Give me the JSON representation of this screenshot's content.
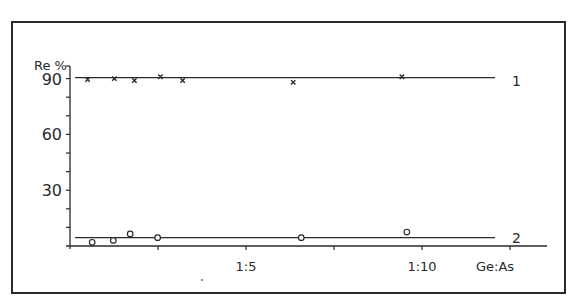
{
  "chart_data": {
    "type": "scatter",
    "title": "",
    "xlabel": "Ge:As",
    "ylabel": "Re %",
    "xlim": [
      0,
      12.5
    ],
    "ylim": [
      0,
      90
    ],
    "x_ticks": [
      0,
      2.5,
      5,
      7.5,
      10,
      12.5
    ],
    "x_tick_labels": [
      {
        "value": 5,
        "label": "1:5"
      },
      {
        "value": 10,
        "label": "1:10"
      }
    ],
    "y_ticks": [
      0,
      10,
      20,
      30,
      40,
      50,
      60,
      70,
      80,
      90
    ],
    "y_tick_labels": [
      {
        "value": 30,
        "label": "30"
      },
      {
        "value": 60,
        "label": "60"
      },
      {
        "value": 90,
        "label": "90"
      }
    ],
    "grid": false,
    "legend": "inline line labels at right",
    "series": [
      {
        "name": "1",
        "marker": "x",
        "fit_line": 90.5,
        "x": [
          0.5,
          1.26,
          1.83,
          2.57,
          3.2,
          6.34,
          9.43
        ],
        "y": [
          89.5,
          90,
          89,
          91,
          89,
          88,
          91
        ]
      },
      {
        "name": "2",
        "marker": "open-circle",
        "fit_line": 4.5,
        "x": [
          0.63,
          1.23,
          1.71,
          2.49,
          6.57,
          9.57
        ],
        "y": [
          2,
          3,
          6.5,
          4.5,
          4.5,
          7.5
        ]
      }
    ]
  },
  "labels": {
    "y_axis_title": "Re %",
    "x_axis_title": "Ge:As",
    "series_1_label": "1",
    "series_2_label": "2"
  },
  "colors": {
    "ink": "#2a2a2a",
    "background": "#ffffff"
  }
}
